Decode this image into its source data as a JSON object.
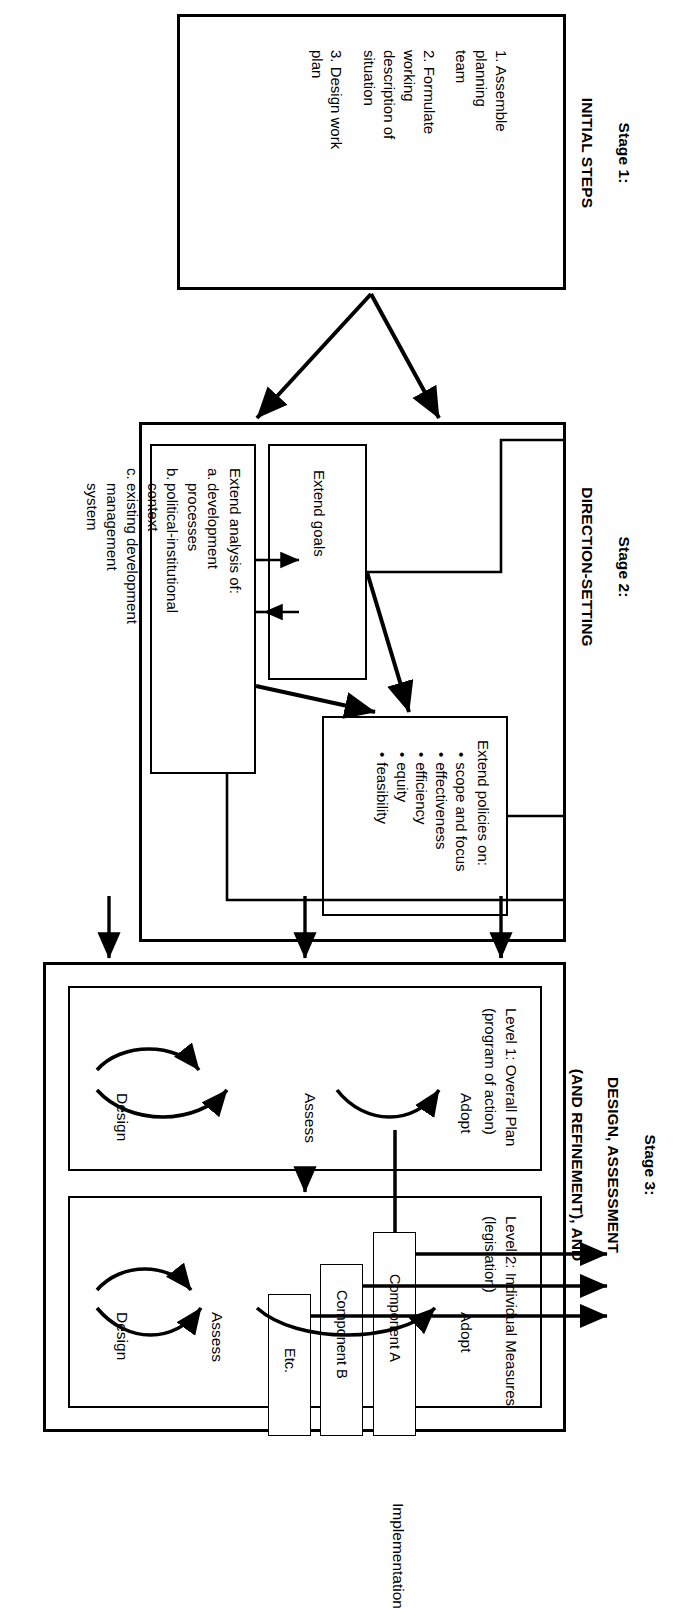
{
  "diagram": {
    "title_note": "Three-stage development planning process flowchart",
    "orientation": "page rotated 90 degrees clockwise"
  },
  "stage1": {
    "title_line1": "Stage 1:",
    "title_line2": "INITIAL STEPS",
    "steps": [
      "1. Assemble\nplanning\nteam",
      "2. Formulate\nworking\ndescription of\nsituation",
      "3. Design work\nplan"
    ]
  },
  "stage2": {
    "title_line1": "Stage 2:",
    "title_line2": "DIRECTION-SETTING",
    "goals_box": "Extend goals",
    "analysis_box": {
      "heading": "Extend analysis of:",
      "items": [
        {
          "key": "a.",
          "text": "development\nprocesses"
        },
        {
          "key": "b.",
          "text": "political-institutional\ncontext"
        },
        {
          "key": "c.",
          "text": "existing development\nmanagement\nsystem"
        }
      ]
    },
    "policies_box": {
      "heading": "Extend policies on:",
      "bullets": [
        "scope and focus",
        "effectiveness",
        "efficiency",
        "equity",
        "feasibility"
      ]
    }
  },
  "stage3": {
    "title_line1": "Stage 3:",
    "title_line2": "DESIGN, ASSESSMENT",
    "title_line3": "(AND REFINEMENT), AND",
    "title_line4": "ADOPTION",
    "level1": {
      "heading": "Level 1:  Overall Plan",
      "subheading": "(program of action)",
      "cycle": [
        "Design",
        "Assess",
        "Adopt"
      ]
    },
    "level2": {
      "heading": "Level 2:  Individual Measures",
      "subheading": "(legislation)",
      "components": [
        "Component A",
        "Component B",
        "Etc."
      ],
      "cycle": [
        "Design",
        "Assess",
        "Adopt"
      ]
    }
  },
  "output": {
    "label": "Implementation"
  },
  "colors": {
    "ink": "#000000",
    "paper": "#ffffff"
  }
}
